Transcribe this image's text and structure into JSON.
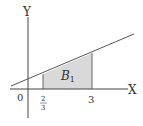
{
  "diagram": {
    "axes": {
      "x_label": "X",
      "y_label": "Y",
      "origin_label": "0"
    },
    "ticks": {
      "a_numerator": "2",
      "a_denominator": "3",
      "b_label": "3"
    },
    "region": {
      "label_main": "B",
      "label_sub": "1",
      "fill_color": "#d9d9d9"
    },
    "line_color": "#555555",
    "axis_color": "#444444"
  }
}
